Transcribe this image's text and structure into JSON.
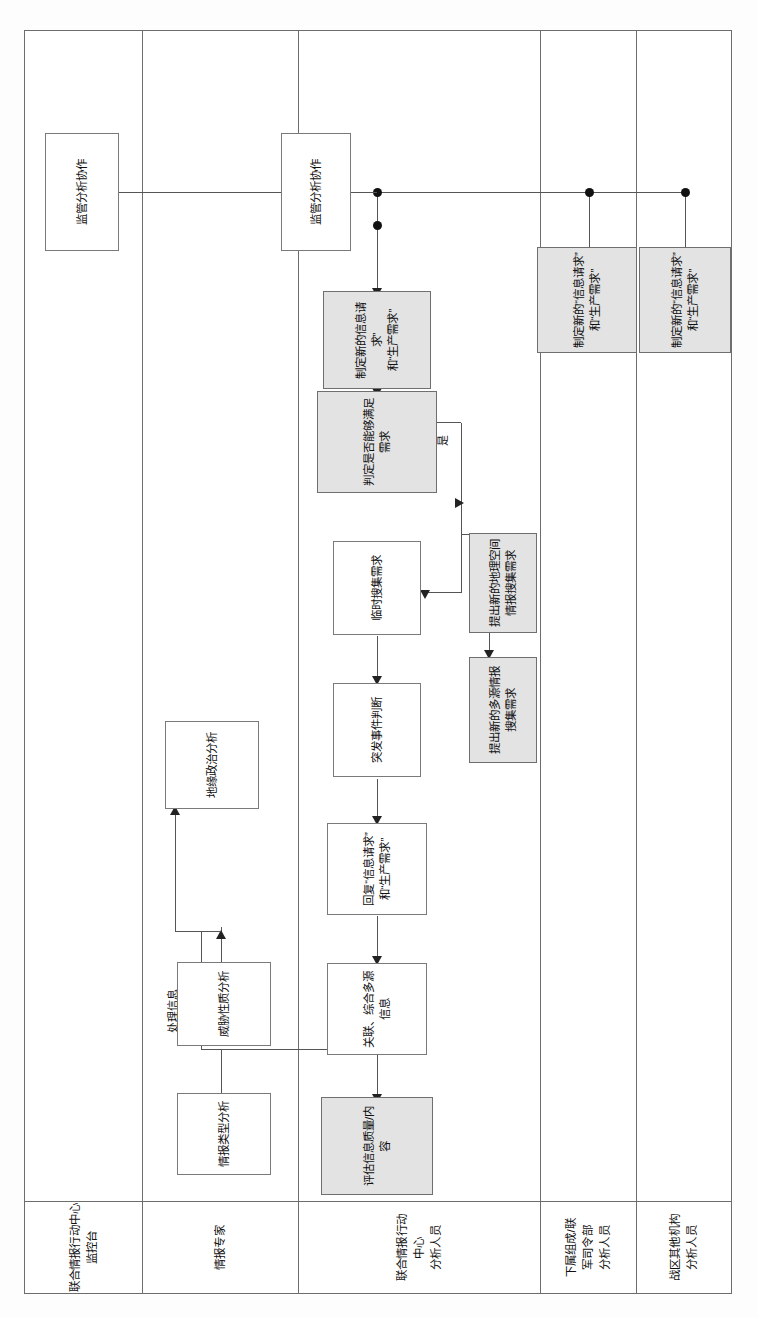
{
  "diagram": {
    "type": "swimlane-flowchart",
    "language": "zh-CN",
    "orientation": "rotated-90-ccw",
    "lanes": [
      {
        "id": "lane-joc-console",
        "label": "联合情报行动中心\n监控台"
      },
      {
        "id": "lane-intel-expert",
        "label": "情报专家"
      },
      {
        "id": "lane-joc-analyst",
        "label": "联合情报行动\n中心\n分析人员"
      },
      {
        "id": "lane-subordinate",
        "label": "下属组成/联\n军司令部\n分析人员"
      },
      {
        "id": "lane-theater-other",
        "label": "战区其他机构\n分析人员"
      }
    ],
    "nodes": [
      {
        "id": "n-supervise-1",
        "lane": 0,
        "label": "监管分析协作",
        "shaded": false
      },
      {
        "id": "n-type",
        "lane": 1,
        "label": "情报类型分析",
        "shaded": false
      },
      {
        "id": "n-threat",
        "lane": 1,
        "label": "威胁性质分析",
        "shaded": false
      },
      {
        "id": "n-geo",
        "lane": 1,
        "label": "地缘政治分析",
        "shaded": false
      },
      {
        "id": "n-correlate",
        "lane": 2,
        "label": "关联、综合多源\n信息",
        "shaded": false
      },
      {
        "id": "n-reply",
        "lane": 2,
        "label": "回复“信息请求”\n和“生产需求”",
        "shaded": false
      },
      {
        "id": "n-emergency",
        "lane": 2,
        "label": "突发事件判断",
        "shaded": false
      },
      {
        "id": "n-adhoc",
        "lane": 2,
        "label": "临时搜集需求",
        "shaded": false
      },
      {
        "id": "n-supervise-2",
        "lane": 2,
        "label": "监管分析协作",
        "shaded": false
      },
      {
        "id": "n-assess",
        "lane": 2,
        "label": "评估信息质量/内容",
        "shaded": true
      },
      {
        "id": "n-decide",
        "lane": 2,
        "label": "判定是否能够满足需求",
        "shaded": true
      },
      {
        "id": "n-geoint-req",
        "lane": 2,
        "label": "提出新的地理空间\n情报搜集需求",
        "shaded": true
      },
      {
        "id": "n-multi-req",
        "lane": 2,
        "label": "提出新的多源情报\n搜集需求",
        "shaded": true
      },
      {
        "id": "n-newreq-1",
        "lane": 2,
        "label": "制定新的信息请求”\n和“生产需求”",
        "shaded": true
      },
      {
        "id": "n-newreq-2",
        "lane": 3,
        "label": "制定新的“信息请求”\n和“生产需求”",
        "shaded": true
      },
      {
        "id": "n-newreq-3",
        "lane": 4,
        "label": "制定新的“信息请求”\n和“生产需求”",
        "shaded": true
      }
    ],
    "edge_labels": [
      {
        "id": "e-process",
        "text": "处理信息"
      },
      {
        "id": "e-no",
        "text": "否"
      },
      {
        "id": "e-yes",
        "text": "是"
      }
    ]
  }
}
